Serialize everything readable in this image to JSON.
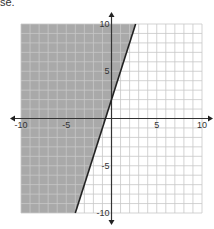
{
  "caption": "se.",
  "chart_data": {
    "type": "inequality-graph",
    "title": "",
    "xlabel": "",
    "ylabel": "",
    "xlim": [
      -10,
      10
    ],
    "ylim": [
      -10,
      10
    ],
    "grid": true,
    "grid_step": 1,
    "x_tick_labels": [
      "-10",
      "-5",
      "5",
      "10"
    ],
    "y_tick_labels": [
      "10",
      "5",
      "-5",
      "-10"
    ],
    "boundary_line": {
      "slope": 3,
      "intercept": 2,
      "style": "solid",
      "equation": "y = 3x + 2"
    },
    "shaded_region": "above-left",
    "inequality": "y ≥ 3x + 2",
    "shade_color": "#a9a9a9",
    "line_color": "#222222"
  }
}
